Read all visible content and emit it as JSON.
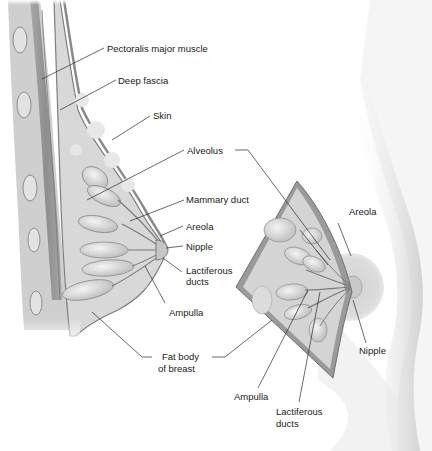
{
  "figure": {
    "colors": {
      "background": "#ffffff",
      "tissue_light": "#e6e6e6",
      "tissue_mid": "#c8c8c8",
      "tissue_dark": "#8a8a8a",
      "outline": "#6e6e6e",
      "skin_shadow": "#bdbdbd",
      "areola": "#d9d9d9",
      "leader_line": "#2a2a2a",
      "text": "#1a1a1a"
    },
    "left_view": {
      "name": "sagittal-section",
      "labels": [
        {
          "id": "pectoralis",
          "text": "Pectoralis major muscle"
        },
        {
          "id": "deep_fascia",
          "text": "Deep fascia"
        },
        {
          "id": "skin",
          "text": "Skin"
        },
        {
          "id": "alveolus",
          "text": "Alveolus"
        },
        {
          "id": "mammary_duct",
          "text": "Mammary duct"
        },
        {
          "id": "areola",
          "text": "Areola"
        },
        {
          "id": "nipple",
          "text": "Nipple"
        },
        {
          "id": "lactiferous_line1",
          "text": "Lactiferous"
        },
        {
          "id": "lactiferous_line2",
          "text": "ducts"
        },
        {
          "id": "ampulla",
          "text": "Ampulla"
        },
        {
          "id": "fat_body_line1",
          "text": "Fat body"
        },
        {
          "id": "fat_body_line2",
          "text": "of breast"
        }
      ]
    },
    "right_view": {
      "name": "anterior-cutaway",
      "labels": [
        {
          "id": "areola",
          "text": "Areola"
        },
        {
          "id": "nipple",
          "text": "Nipple"
        },
        {
          "id": "ampulla",
          "text": "Ampulla"
        },
        {
          "id": "lactiferous_line1",
          "text": "Lactiferous"
        },
        {
          "id": "lactiferous_line2",
          "text": "ducts"
        }
      ]
    }
  }
}
